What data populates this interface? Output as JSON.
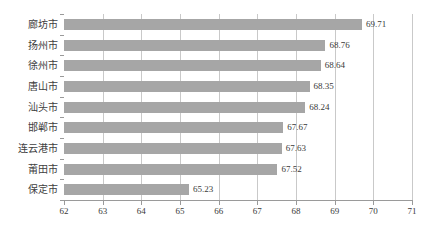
{
  "chart_data": {
    "type": "bar",
    "orientation": "horizontal",
    "title": "",
    "subtitle": "",
    "xlabel": "",
    "ylabel": "",
    "categories": [
      "廊坊市",
      "扬州市",
      "徐州市",
      "唐山市",
      "汕头市",
      "邯郸市",
      "连云港市",
      "莆田市",
      "保定市"
    ],
    "values": [
      69.71,
      68.76,
      68.64,
      68.35,
      68.24,
      67.67,
      67.63,
      67.52,
      65.23
    ],
    "value_labels": [
      "69.71",
      "68.76",
      "68.64",
      "68.35",
      "68.24",
      "67.67",
      "67.63",
      "67.52",
      "65.23"
    ],
    "xlim": [
      62,
      71
    ],
    "xticks": [
      62,
      63,
      64,
      65,
      66,
      67,
      68,
      69,
      70,
      71
    ],
    "xtick_labels": [
      "62",
      "63",
      "64",
      "65",
      "66",
      "67",
      "68",
      "69",
      "70",
      "71"
    ],
    "grid": true,
    "grid_axis": "x",
    "legend": false,
    "legend_position": "none",
    "series": [
      {
        "name": "",
        "values": [
          69.71,
          68.76,
          68.64,
          68.35,
          68.24,
          67.67,
          67.63,
          67.52,
          65.23
        ]
      }
    ]
  },
  "style": {
    "bar_color": "#a6a6a6",
    "grid_color": "#c9c9c9",
    "axis_color": "#9a9a9a",
    "text_color": "#3a3a3a",
    "background": "#ffffff"
  }
}
